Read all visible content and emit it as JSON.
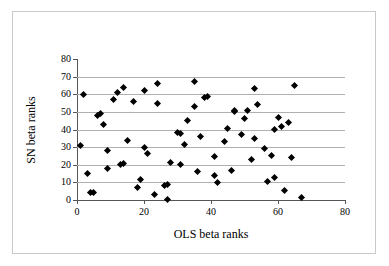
{
  "chart_data": {
    "type": "scatter",
    "title": "",
    "xlabel": "OLS beta ranks",
    "ylabel": "SN beta ranks",
    "xlim": [
      0,
      80
    ],
    "ylim": [
      0,
      80
    ],
    "xticks": [
      0,
      20,
      40,
      60,
      80
    ],
    "yticks": [
      0,
      10,
      20,
      30,
      40,
      50,
      60,
      70,
      80
    ],
    "xtick_labels": [
      "0",
      "20",
      "40",
      "60",
      "80"
    ],
    "ytick_labels": [
      "0",
      "10",
      "20",
      "30",
      "40",
      "50",
      "60",
      "70",
      "80"
    ],
    "grid": "horizontal",
    "gridlines_y": [
      10,
      20,
      30,
      40,
      50,
      60,
      70
    ],
    "marker": "diamond",
    "marker_color": "#000000",
    "legend": "none",
    "series": [
      {
        "name": "beta ranks",
        "points": [
          [
            1,
            31
          ],
          [
            2,
            60
          ],
          [
            3,
            15
          ],
          [
            4,
            4.5
          ],
          [
            5,
            4
          ],
          [
            6,
            48
          ],
          [
            7,
            49
          ],
          [
            8,
            43
          ],
          [
            9,
            18
          ],
          [
            9,
            28
          ],
          [
            11,
            57
          ],
          [
            12,
            61
          ],
          [
            13,
            20
          ],
          [
            14,
            20.5
          ],
          [
            14,
            64
          ],
          [
            15,
            34
          ],
          [
            17,
            56
          ],
          [
            18,
            7
          ],
          [
            19,
            11.5
          ],
          [
            20,
            30
          ],
          [
            20,
            62
          ],
          [
            21,
            26.5
          ],
          [
            23,
            3
          ],
          [
            24,
            55
          ],
          [
            24,
            66
          ],
          [
            26,
            8
          ],
          [
            27,
            0.5
          ],
          [
            27,
            9
          ],
          [
            28,
            21.5
          ],
          [
            30,
            38.5
          ],
          [
            31,
            38
          ],
          [
            31,
            20
          ],
          [
            32,
            31.5
          ],
          [
            33,
            45
          ],
          [
            35,
            53
          ],
          [
            35,
            67
          ],
          [
            36,
            16
          ],
          [
            37,
            36
          ],
          [
            38,
            58
          ],
          [
            39,
            59
          ],
          [
            41,
            14
          ],
          [
            41,
            24.5
          ],
          [
            42,
            10
          ],
          [
            44,
            33
          ],
          [
            45,
            40.5
          ],
          [
            46,
            17
          ],
          [
            47,
            50
          ],
          [
            47,
            51
          ],
          [
            49,
            37
          ],
          [
            50,
            46
          ],
          [
            51,
            50.5
          ],
          [
            52,
            23
          ],
          [
            53,
            35
          ],
          [
            53,
            63
          ],
          [
            54,
            54
          ],
          [
            56,
            29
          ],
          [
            57,
            10.5
          ],
          [
            58,
            25.5
          ],
          [
            59,
            13
          ],
          [
            59,
            40
          ],
          [
            60,
            47
          ],
          [
            61,
            41.5
          ],
          [
            62,
            5.5
          ],
          [
            63,
            44
          ],
          [
            64,
            24
          ],
          [
            65,
            65
          ],
          [
            67,
            1.5
          ]
        ]
      }
    ]
  },
  "figure": {
    "background": "#ffffff",
    "frame_color": "#c9c9c9",
    "axis_color": "#555555",
    "gridline_color": "#b0b0b0"
  }
}
